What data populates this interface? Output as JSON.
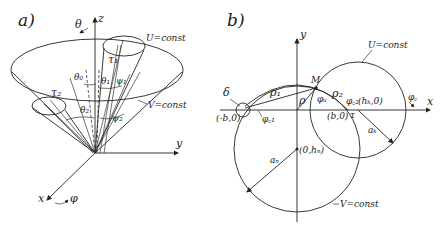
{
  "panel_a": {
    "label": "a)",
    "axes": {
      "z": "z",
      "y": "y",
      "x": "x"
    },
    "labels": {
      "theta": "θ",
      "phi": "φ",
      "u_const": "U=const",
      "v_const": "V=const",
      "tau1": "τ₁",
      "tau2": "τ₂",
      "theta0": "θ₀",
      "theta1": "θ₁",
      "theta2": "θ₂",
      "psi1": "ψ₁",
      "psi2": "ψ₂"
    }
  },
  "panel_b": {
    "label": "b)",
    "axes": {
      "x": "x",
      "y": "y"
    },
    "labels": {
      "u_const": "U=const",
      "v_const": "V=const",
      "point_m": "M",
      "delta": "δ",
      "rho1": "ρ₁",
      "rho2": "ρ₂",
      "rho": "ρ",
      "phi_u": "φᵤ",
      "phi_c1": "φ꜀₁",
      "phi_c2": "φ꜀₂",
      "phi_c": "φ꜀",
      "tau": "τ",
      "minus_b0": "(-b,0)",
      "b0": "(b,0)",
      "hk0": "(hₖ,0)",
      "zero_hn": "(0,hₙ)",
      "a_n": "aₙ",
      "a_k": "aₖ"
    }
  }
}
